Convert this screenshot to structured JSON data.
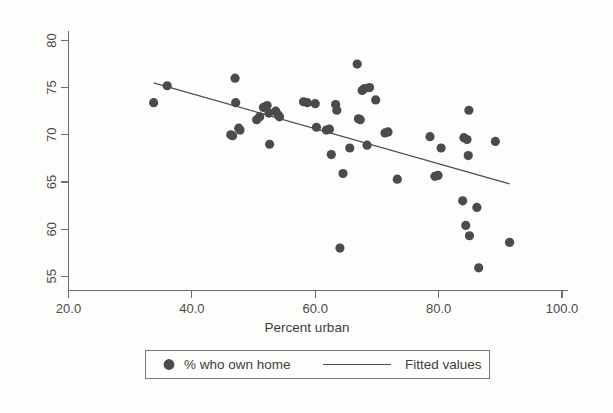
{
  "chart_data": {
    "type": "scatter",
    "title": "",
    "xlabel": "Percent urban",
    "ylabel": "",
    "xlim": [
      20.0,
      100.0
    ],
    "ylim": [
      53.5,
      81.0
    ],
    "xticks": [
      "20.0",
      "40.0",
      "60.0",
      "80.0",
      "100.0"
    ],
    "xtick_values": [
      20.0,
      40.0,
      60.0,
      80.0,
      100.0
    ],
    "yticks": [
      "55",
      "60",
      "65",
      "70",
      "75",
      "80"
    ],
    "ytick_values": [
      55,
      60,
      65,
      70,
      75,
      80
    ],
    "grid": false,
    "legend_position": "bottom",
    "marker_color": "#4b4b4b",
    "line_color": "#4d4d4d",
    "axis_color": "#6e6e6e",
    "series": [
      {
        "name": "% who own home",
        "type": "scatter",
        "marker": "filled-circle",
        "points": [
          [
            33.8,
            73.4
          ],
          [
            36.0,
            75.2
          ],
          [
            46.3,
            70.0
          ],
          [
            46.6,
            69.9
          ],
          [
            47.0,
            76.0
          ],
          [
            47.1,
            73.4
          ],
          [
            47.6,
            70.7
          ],
          [
            47.8,
            70.5
          ],
          [
            50.5,
            71.6
          ],
          [
            51.0,
            71.9
          ],
          [
            51.6,
            72.9
          ],
          [
            52.2,
            73.1
          ],
          [
            52.5,
            72.3
          ],
          [
            52.6,
            69.0
          ],
          [
            53.6,
            72.5
          ],
          [
            54.0,
            72.1
          ],
          [
            54.2,
            71.9
          ],
          [
            58.1,
            73.5
          ],
          [
            58.7,
            73.4
          ],
          [
            60.0,
            73.3
          ],
          [
            60.2,
            70.8
          ],
          [
            61.8,
            70.5
          ],
          [
            62.3,
            70.6
          ],
          [
            62.6,
            67.9
          ],
          [
            63.3,
            73.2
          ],
          [
            63.5,
            72.6
          ],
          [
            64.0,
            58.0
          ],
          [
            64.5,
            65.9
          ],
          [
            65.6,
            68.6
          ],
          [
            66.8,
            77.5
          ],
          [
            67.0,
            71.7
          ],
          [
            67.3,
            71.6
          ],
          [
            67.6,
            74.7
          ],
          [
            68.0,
            74.9
          ],
          [
            68.4,
            68.9
          ],
          [
            68.8,
            75.0
          ],
          [
            69.8,
            73.7
          ],
          [
            71.3,
            70.2
          ],
          [
            71.8,
            70.3
          ],
          [
            73.3,
            65.3
          ],
          [
            78.6,
            69.8
          ],
          [
            79.4,
            65.6
          ],
          [
            79.9,
            65.7
          ],
          [
            80.4,
            68.6
          ],
          [
            83.9,
            63.0
          ],
          [
            84.1,
            69.7
          ],
          [
            84.4,
            60.4
          ],
          [
            84.6,
            69.5
          ],
          [
            84.8,
            67.8
          ],
          [
            84.9,
            72.6
          ],
          [
            85.0,
            59.3
          ],
          [
            86.2,
            62.3
          ],
          [
            86.5,
            55.9
          ],
          [
            89.2,
            69.3
          ],
          [
            91.5,
            58.6
          ]
        ]
      },
      {
        "name": "Fitted values",
        "type": "line",
        "endpoints": [
          [
            33.8,
            75.5
          ],
          [
            91.5,
            64.8
          ]
        ]
      }
    ]
  },
  "legend": {
    "items": [
      {
        "label": "% who own home",
        "symbol": "filled-circle"
      },
      {
        "label": "Fitted values",
        "symbol": "line-segment"
      }
    ]
  }
}
